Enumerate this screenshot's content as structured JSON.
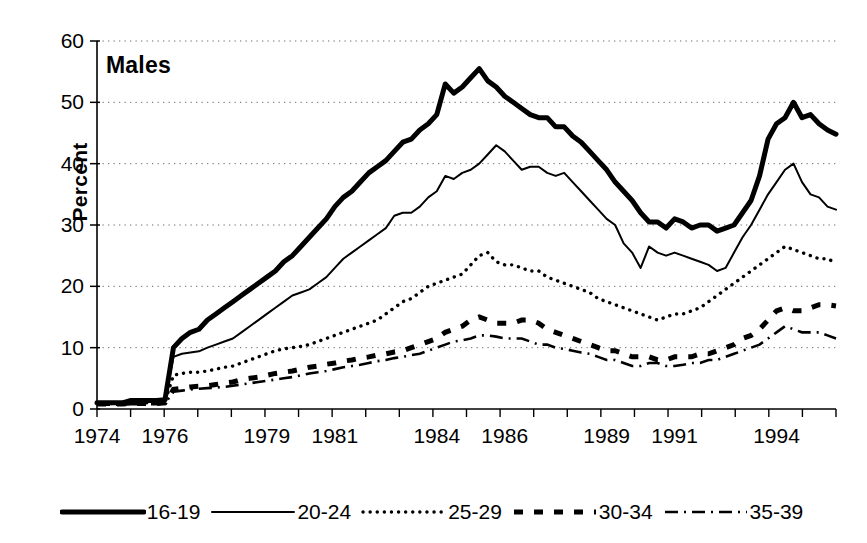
{
  "chart_data": {
    "type": "line",
    "title": "Males",
    "xlabel": "",
    "ylabel": "Percent",
    "ylim": [
      0,
      60
    ],
    "ytick_values": [
      0,
      10,
      20,
      30,
      40,
      50,
      60
    ],
    "ytick_labels": [
      "0",
      "10",
      "20",
      "30",
      "40",
      "50",
      "60"
    ],
    "xlim": [
      1974.0,
      1995.75
    ],
    "xtick_labels": [
      "1974",
      "1976",
      "1979",
      "1981",
      "1984",
      "1986",
      "1989",
      "1991",
      "1994"
    ],
    "xtick_values": [
      1974,
      1976,
      1979,
      1981,
      1984,
      1986,
      1989,
      1991,
      1994
    ],
    "grid": "horizontal-dotted",
    "legend_position": "bottom",
    "x": [
      1974.0,
      1974.25,
      1974.5,
      1974.75,
      1975.0,
      1975.25,
      1975.5,
      1975.75,
      1976.0,
      1976.25,
      1976.5,
      1976.75,
      1977.0,
      1977.25,
      1977.5,
      1977.75,
      1978.0,
      1978.25,
      1978.5,
      1978.75,
      1979.0,
      1979.25,
      1979.5,
      1979.75,
      1980.0,
      1980.25,
      1980.5,
      1980.75,
      1981.0,
      1981.25,
      1981.5,
      1981.75,
      1982.0,
      1982.25,
      1982.5,
      1982.75,
      1983.0,
      1983.25,
      1983.5,
      1983.75,
      1984.0,
      1984.25,
      1984.5,
      1984.75,
      1985.0,
      1985.25,
      1985.5,
      1985.75,
      1986.0,
      1986.25,
      1986.5,
      1986.75,
      1987.0,
      1987.25,
      1987.5,
      1987.75,
      1988.0,
      1988.25,
      1988.5,
      1988.75,
      1989.0,
      1989.25,
      1989.5,
      1989.75,
      1990.0,
      1990.25,
      1990.5,
      1990.75,
      1991.0,
      1991.25,
      1991.5,
      1991.75,
      1992.0,
      1992.25,
      1992.5,
      1992.75,
      1993.0,
      1993.25,
      1993.5,
      1993.75,
      1994.0,
      1994.25,
      1994.5,
      1994.75,
      1995.0,
      1995.25,
      1995.5,
      1995.75
    ],
    "series": [
      {
        "name": "16-19",
        "style": "thick-solid",
        "values": [
          1.0,
          1.0,
          1.0,
          1.0,
          1.4,
          1.4,
          1.4,
          1.4,
          1.5,
          10.0,
          11.5,
          12.5,
          13.0,
          14.5,
          15.5,
          16.5,
          17.5,
          18.5,
          19.5,
          20.5,
          21.5,
          22.5,
          24.0,
          25.0,
          26.5,
          28.0,
          29.5,
          31.0,
          33.0,
          34.5,
          35.5,
          37.0,
          38.5,
          39.5,
          40.5,
          42.0,
          43.5,
          44.0,
          45.5,
          46.5,
          48.0,
          53.0,
          51.5,
          52.5,
          54.0,
          55.5,
          53.5,
          52.5,
          51.0,
          50.0,
          49.0,
          48.0,
          47.5,
          47.5,
          46.0,
          46.0,
          44.5,
          43.5,
          42.0,
          40.5,
          39.0,
          37.0,
          35.5,
          34.0,
          32.0,
          30.5,
          30.5,
          29.5,
          31.0,
          30.5,
          29.5,
          30.0,
          30.0,
          29.0,
          29.5,
          30.0,
          32.0,
          34.0,
          38.0,
          44.0,
          46.5,
          47.5,
          50.0,
          47.5,
          48.0,
          46.5,
          45.5,
          44.8
        ]
      },
      {
        "name": "20-24",
        "style": "thin-solid",
        "values": [
          1.0,
          1.0,
          1.0,
          1.0,
          1.2,
          1.2,
          1.2,
          1.2,
          1.3,
          8.5,
          9.0,
          9.2,
          9.4,
          10.0,
          10.5,
          11.0,
          11.5,
          12.5,
          13.5,
          14.5,
          15.5,
          16.5,
          17.5,
          18.5,
          19.0,
          19.5,
          20.5,
          21.5,
          23.0,
          24.5,
          25.5,
          26.5,
          27.5,
          28.5,
          29.5,
          31.5,
          32.0,
          32.0,
          33.0,
          34.5,
          35.5,
          38.0,
          37.5,
          38.5,
          39.0,
          40.0,
          41.5,
          43.0,
          42.0,
          40.5,
          39.0,
          39.5,
          39.5,
          38.5,
          38.0,
          38.5,
          37.0,
          35.5,
          34.0,
          32.5,
          31.0,
          30.0,
          27.0,
          25.5,
          23.0,
          26.5,
          25.5,
          25.0,
          25.5,
          25.0,
          24.5,
          24.0,
          23.5,
          22.5,
          23.0,
          25.5,
          28.0,
          30.0,
          32.5,
          35.0,
          37.0,
          39.0,
          40.0,
          37.0,
          35.0,
          34.5,
          33.0,
          32.5
        ]
      },
      {
        "name": "25-29",
        "style": "dotted",
        "values": [
          0.9,
          0.9,
          0.9,
          0.9,
          1.0,
          1.0,
          1.0,
          1.0,
          1.1,
          5.5,
          5.8,
          6.0,
          6.0,
          6.2,
          6.5,
          6.8,
          7.0,
          7.5,
          8.0,
          8.5,
          9.0,
          9.5,
          9.8,
          10.0,
          10.2,
          10.5,
          11.0,
          11.5,
          12.0,
          12.5,
          13.0,
          13.5,
          14.0,
          14.5,
          15.5,
          16.5,
          17.5,
          18.0,
          19.0,
          20.0,
          20.5,
          21.0,
          21.5,
          22.0,
          23.5,
          25.0,
          25.5,
          24.0,
          23.5,
          23.5,
          23.0,
          22.5,
          22.5,
          21.5,
          21.0,
          20.5,
          20.0,
          19.5,
          19.0,
          18.0,
          17.5,
          17.0,
          16.5,
          16.0,
          15.5,
          15.0,
          14.5,
          15.0,
          15.5,
          15.5,
          16.0,
          16.5,
          17.5,
          18.5,
          19.5,
          20.5,
          21.5,
          22.5,
          23.5,
          24.5,
          25.5,
          26.5,
          26.0,
          25.5,
          25.0,
          24.5,
          24.5,
          23.8
        ]
      },
      {
        "name": "30-34",
        "style": "thick-dashed",
        "values": [
          0.8,
          0.8,
          0.8,
          0.8,
          0.9,
          0.9,
          0.9,
          0.9,
          1.0,
          3.2,
          3.4,
          3.6,
          3.7,
          3.8,
          4.0,
          4.2,
          4.4,
          4.8,
          5.0,
          5.2,
          5.5,
          5.8,
          6.0,
          6.2,
          6.5,
          6.8,
          7.0,
          7.3,
          7.5,
          7.8,
          8.0,
          8.3,
          8.5,
          8.8,
          9.0,
          9.3,
          9.5,
          10.0,
          10.5,
          11.0,
          11.5,
          12.5,
          13.0,
          13.5,
          14.5,
          15.0,
          14.5,
          14.0,
          14.0,
          14.0,
          14.5,
          14.5,
          14.0,
          13.0,
          12.5,
          12.0,
          11.5,
          11.0,
          10.5,
          10.0,
          9.5,
          9.5,
          9.0,
          8.5,
          8.5,
          8.5,
          8.0,
          8.0,
          8.5,
          8.5,
          8.5,
          9.0,
          9.0,
          9.5,
          10.0,
          10.5,
          11.5,
          12.0,
          13.0,
          14.5,
          16.0,
          16.5,
          16.0,
          16.0,
          16.5,
          17.0,
          17.0,
          16.8
        ]
      },
      {
        "name": "35-39",
        "style": "dash-dot",
        "values": [
          0.7,
          0.7,
          0.7,
          0.7,
          0.8,
          0.8,
          0.8,
          0.8,
          0.9,
          2.8,
          3.0,
          3.2,
          3.3,
          3.4,
          3.5,
          3.6,
          3.8,
          4.0,
          4.2,
          4.4,
          4.6,
          4.8,
          5.0,
          5.2,
          5.5,
          5.8,
          6.0,
          6.2,
          6.5,
          6.8,
          7.0,
          7.2,
          7.5,
          7.8,
          8.0,
          8.3,
          8.5,
          8.8,
          9.0,
          9.5,
          10.0,
          10.5,
          11.0,
          11.2,
          11.5,
          12.0,
          12.0,
          11.8,
          11.5,
          11.5,
          11.5,
          11.0,
          10.5,
          10.5,
          10.0,
          9.8,
          9.5,
          9.2,
          9.0,
          8.5,
          8.0,
          8.0,
          7.5,
          7.0,
          7.0,
          7.5,
          7.5,
          7.0,
          7.0,
          7.2,
          7.5,
          7.5,
          8.0,
          8.0,
          8.5,
          9.0,
          9.5,
          10.0,
          10.5,
          11.5,
          12.5,
          13.5,
          13.0,
          12.5,
          12.5,
          12.5,
          12.0,
          11.5
        ]
      }
    ]
  },
  "legend": {
    "items": [
      {
        "label": "16-19",
        "style": "thick-solid"
      },
      {
        "label": "20-24",
        "style": "thin-solid"
      },
      {
        "label": "25-29",
        "style": "dotted"
      },
      {
        "label": "30-34",
        "style": "thick-dashed"
      },
      {
        "label": "35-39",
        "style": "dash-dot"
      }
    ]
  },
  "colors": {
    "ink": "#000000",
    "grid": "#6b6b6b",
    "background": "#ffffff"
  }
}
